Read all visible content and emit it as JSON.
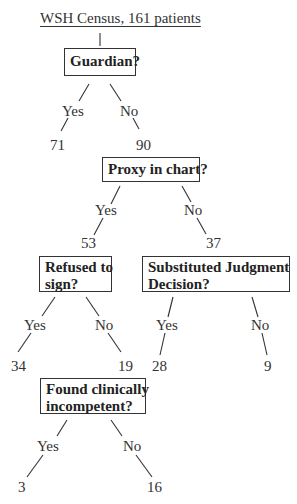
{
  "title": "WSH Census, 161 patients",
  "nodes": {
    "guardian": {
      "question": "Guardian?",
      "yes_label": "Yes",
      "no_label": "No",
      "yes_count": "71",
      "no_count": "90"
    },
    "proxy": {
      "question": "Proxy in chart?",
      "yes_label": "Yes",
      "no_label": "No",
      "yes_count": "53",
      "no_count": "37"
    },
    "refused": {
      "question_line1": "Refused to",
      "question_line2": "sign?",
      "yes_label": "Yes",
      "no_label": "No",
      "yes_count": "34",
      "no_count": "19"
    },
    "substituted": {
      "question_line1": "Substituted Judgment",
      "question_line2": "Decision?",
      "yes_label": "Yes",
      "no_label": "No",
      "yes_count": "28",
      "no_count": "9"
    },
    "incompetent": {
      "question_line1": "Found clinically",
      "question_line2": "incompetent?",
      "yes_label": "Yes",
      "no_label": "No",
      "yes_count": "3",
      "no_count": "16"
    }
  }
}
